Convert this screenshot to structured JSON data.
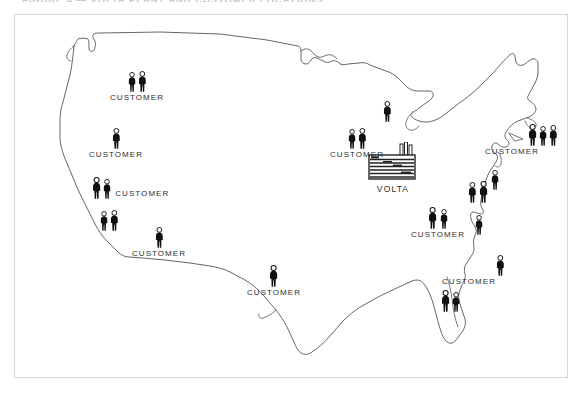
{
  "figure": {
    "title": "FIGURE 4 — VOLTA PLANT AND CUSTOMER LOCATIONS",
    "frame_color": "#d7d7da",
    "background": "#ffffff",
    "ink_color": "#2d2d2d"
  },
  "map": {
    "name": "united-states-outline",
    "stroke": "#555555",
    "fill": "none"
  },
  "plant": {
    "label": "VOLTA",
    "icon": "factory-icon",
    "smokestacks": 3,
    "x": 352,
    "y": 127
  },
  "legend_terms": {
    "customer": "CUSTOMER"
  },
  "markers": [
    {
      "id": "mk-pacific-northwest",
      "label": "CUSTOMER",
      "people": 2,
      "x": 95,
      "y": 56,
      "label_pos": "below"
    },
    {
      "id": "mk-north-california",
      "label": "CUSTOMER",
      "people": 1,
      "x": 74,
      "y": 113,
      "label_pos": "below"
    },
    {
      "id": "mk-central-california",
      "label": "CUSTOMER",
      "people": 2,
      "x": 76,
      "y": 162,
      "label_pos": "right"
    },
    {
      "id": "mk-south-california",
      "label": "",
      "people": 2,
      "x": 84,
      "y": 195,
      "label_pos": "none"
    },
    {
      "id": "mk-southwest",
      "label": "CUSTOMER",
      "people": 1,
      "x": 117,
      "y": 212,
      "label_pos": "below"
    },
    {
      "id": "mk-texas",
      "label": "CUSTOMER",
      "people": 1,
      "x": 232,
      "y": 250,
      "label_pos": "below"
    },
    {
      "id": "mk-midwest",
      "label": "CUSTOMER",
      "people": 2,
      "x": 315,
      "y": 113,
      "label_pos": "below"
    },
    {
      "id": "mk-great-lakes",
      "label": "",
      "people": 1,
      "x": 367,
      "y": 86,
      "label_pos": "none"
    },
    {
      "id": "mk-new-england",
      "label": "CUSTOMER",
      "people": 3,
      "x": 484,
      "y": 109,
      "label_pos": "belowleft"
    },
    {
      "id": "mk-mid-atlantic",
      "label": "",
      "people": 1,
      "x": 475,
      "y": 155,
      "label_pos": "none"
    },
    {
      "id": "mk-appalachia",
      "label": "",
      "people": 2,
      "x": 452,
      "y": 166,
      "label_pos": "none"
    },
    {
      "id": "mk-southeast",
      "label": "CUSTOMER",
      "people": 2,
      "x": 396,
      "y": 192,
      "label_pos": "below"
    },
    {
      "id": "mk-carolinas",
      "label": "",
      "people": 1,
      "x": 459,
      "y": 200,
      "label_pos": "none"
    },
    {
      "id": "mk-georgia",
      "label": "CUSTOMER",
      "people": 1,
      "x": 441,
      "y": 240,
      "label_pos": "belowleft"
    },
    {
      "id": "mk-florida",
      "label": "",
      "people": 2,
      "x": 425,
      "y": 275,
      "label_pos": "none"
    }
  ]
}
